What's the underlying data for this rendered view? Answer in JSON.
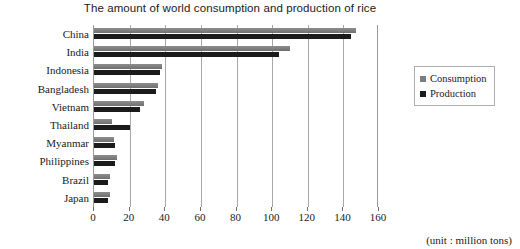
{
  "chart_data": {
    "type": "bar",
    "orientation": "horizontal",
    "title": "The amount of world consumption and production of rice",
    "xlabel": "",
    "ylabel": "",
    "unit_note": "(unit : million tons)",
    "xlim": [
      0,
      160
    ],
    "xticks": [
      0,
      20,
      40,
      60,
      80,
      100,
      120,
      140,
      160
    ],
    "grid": true,
    "legend_position": "right",
    "categories": [
      "China",
      "India",
      "Indonesia",
      "Bangladesh",
      "Vietnam",
      "Thailand",
      "Myanmar",
      "Philippines",
      "Brazil",
      "Japan"
    ],
    "series": [
      {
        "name": "Consumption",
        "color": "#7d7d7d",
        "values": [
          147,
          110,
          38,
          36,
          28,
          10,
          11,
          13,
          9,
          9
        ]
      },
      {
        "name": "Production",
        "color": "#1b1b1b",
        "values": [
          144,
          104,
          37,
          35,
          26,
          20,
          12,
          12,
          8,
          8
        ]
      }
    ]
  }
}
